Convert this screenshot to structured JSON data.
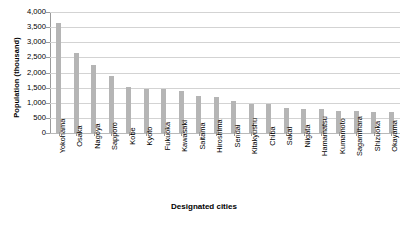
{
  "chart_data": {
    "type": "bar",
    "title": "",
    "xlabel": "Designated cities",
    "ylabel": "Population (thousand)",
    "ylim": [
      0,
      4000
    ],
    "ytick_step": 500,
    "yticks": [
      "4,000",
      "3,500",
      "3,000",
      "2,500",
      "2,000",
      "1,500",
      "1,000",
      "500",
      "0"
    ],
    "grid": true,
    "legend": "none",
    "bar_color": "#b5b5b5",
    "categories": [
      "Yokohama",
      "Osaka",
      "Nagoya",
      "Sapporo",
      "Kobe",
      "Kyoto",
      "Fukuoka",
      "Kawasaki",
      "Saitama",
      "Hiroshima",
      "Sendai",
      "Kitakyushu",
      "Chiba",
      "Sakai",
      "Niigata",
      "Hamamatsu",
      "Kumamoto",
      "Sagamihara",
      "Shizuoka",
      "Okayama"
    ],
    "values": [
      3650,
      2650,
      2250,
      1900,
      1530,
      1470,
      1460,
      1400,
      1240,
      1180,
      1060,
      970,
      960,
      840,
      810,
      790,
      730,
      720,
      710,
      700
    ]
  }
}
